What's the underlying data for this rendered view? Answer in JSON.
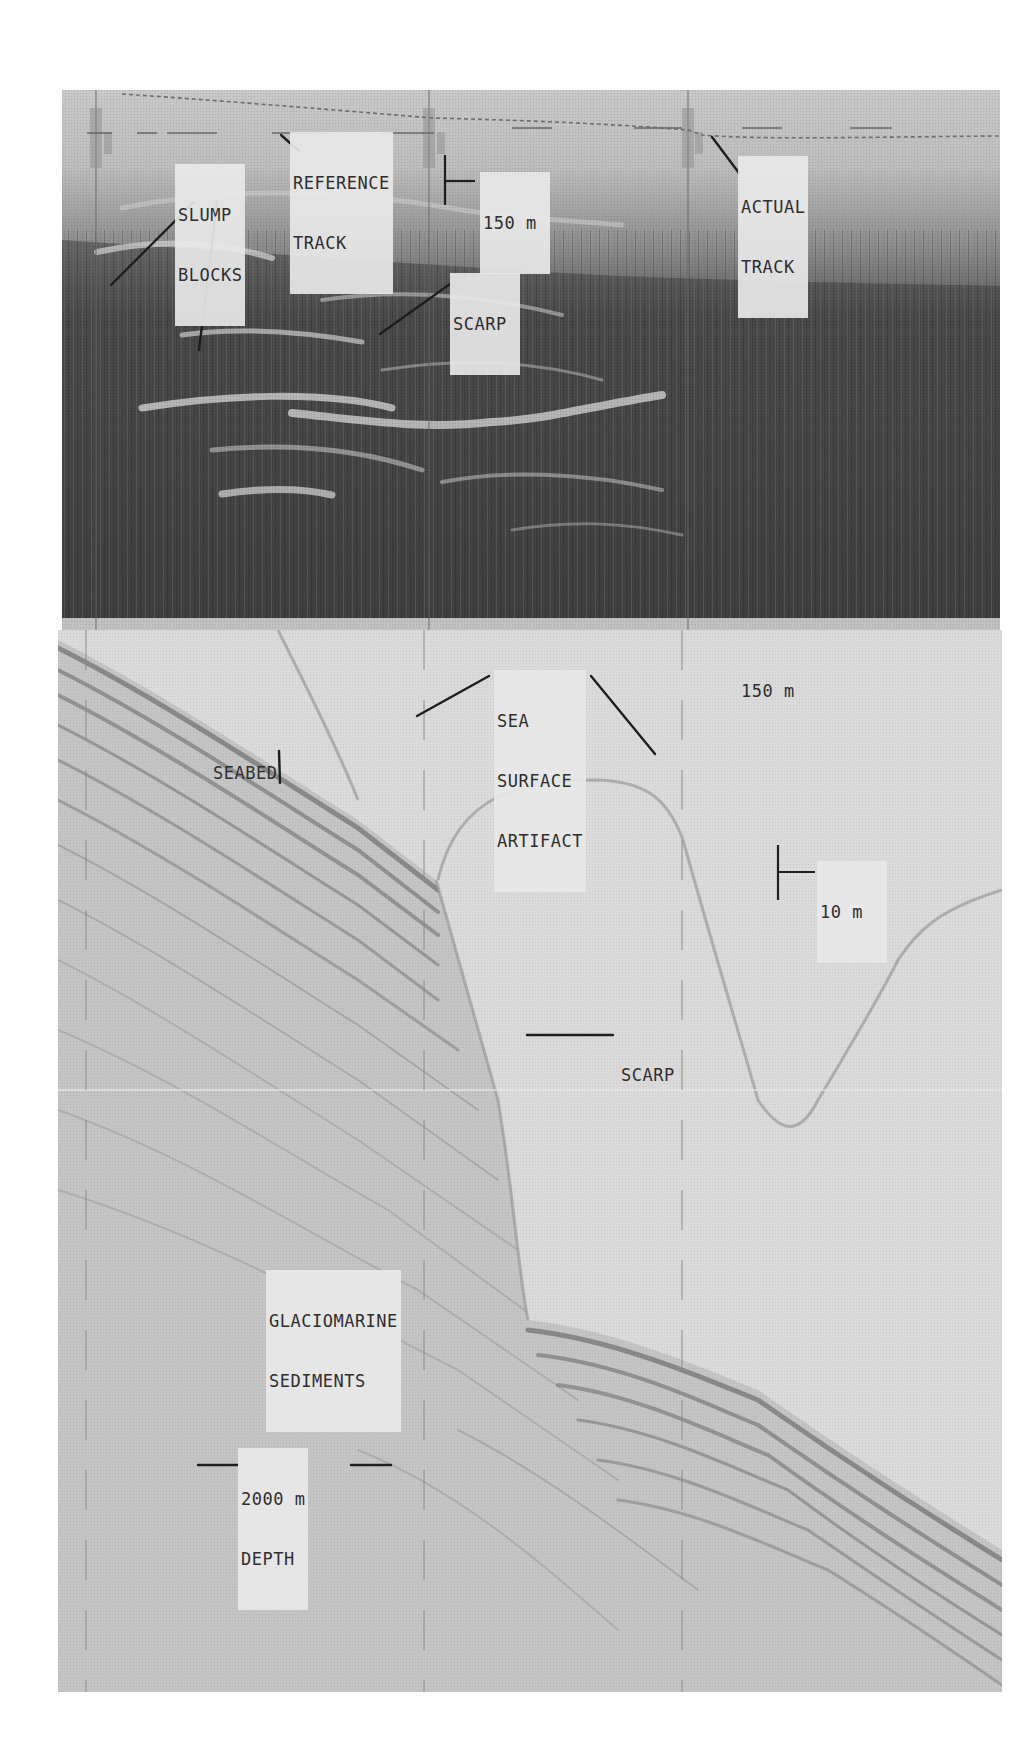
{
  "figure": {
    "top_panel": {
      "description": "side-scan sonar record",
      "labels": {
        "slump_blocks": [
          "SLUMP",
          "BLOCKS"
        ],
        "reference_track": [
          "REFERENCE",
          "TRACK"
        ],
        "actual_track": [
          "ACTUAL",
          "TRACK"
        ],
        "scarp": "SCARP",
        "scale_150m": "150 m"
      }
    },
    "bottom_panel": {
      "description": "sub-bottom profile record",
      "labels": {
        "scale_150m": "150 m",
        "seabed": "SEABED",
        "sea_surface_artifact": [
          "SEA",
          "SURFACE",
          "ARTIFACT"
        ],
        "scale_10m": "10 m",
        "scarp": "SCARP",
        "glaciomarine_sediments": [
          "GLACIOMARINE",
          "SEDIMENTS"
        ],
        "depth_scale": [
          "2000 m",
          "DEPTH"
        ]
      }
    },
    "colors": {
      "background": "#ffffff",
      "top_panel_dark": "#3c3c3c",
      "bottom_panel_light": "#d9d9d9",
      "label_text": "#2e2e2e",
      "leader_line": "#1e1e1e"
    }
  }
}
